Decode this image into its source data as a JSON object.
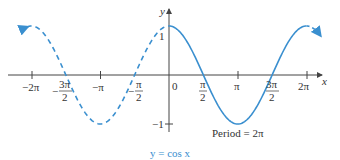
{
  "chart_data": {
    "type": "line",
    "title": "",
    "caption": "y = cos x",
    "xlabel": "x",
    "ylabel": "y",
    "xlim": [
      -6.6,
      7.0
    ],
    "ylim": [
      -1.2,
      1.4
    ],
    "grid": false,
    "x_ticks": [
      {
        "value": -6.2832,
        "label": "−2π"
      },
      {
        "value": -4.7124,
        "label_num": "−3π",
        "label_den": "2"
      },
      {
        "value": -3.1416,
        "label": "−π"
      },
      {
        "value": -1.5708,
        "label_num": "− π",
        "label_den": "2"
      },
      {
        "value": 0,
        "label": "0"
      },
      {
        "value": 1.5708,
        "label_num": "π",
        "label_den": "2"
      },
      {
        "value": 3.1416,
        "label": "π"
      },
      {
        "value": 4.7124,
        "label_num": "3π",
        "label_den": "2"
      },
      {
        "value": 6.2832,
        "label": "2π"
      }
    ],
    "y_ticks": [
      {
        "value": 1,
        "label": "1"
      },
      {
        "value": -1,
        "label": "−1"
      }
    ],
    "series": [
      {
        "name": "cos x (dashed, x < 0)",
        "function": "cos(x)",
        "x_range": [
          -6.5,
          0
        ],
        "style": "dashed",
        "color": "#3a8fcf"
      },
      {
        "name": "cos x (solid, one period)",
        "function": "cos(x)",
        "x_range": [
          0,
          6.2832
        ],
        "style": "solid",
        "color": "#3a8fcf"
      },
      {
        "name": "cos x (dashed, x > 2π)",
        "function": "cos(x)",
        "x_range": [
          6.2832,
          6.9
        ],
        "style": "dashed",
        "color": "#3a8fcf"
      }
    ],
    "key_points": [
      {
        "x": 0,
        "y": 1
      },
      {
        "x": 1.5708,
        "y": 0
      },
      {
        "x": 3.1416,
        "y": -1
      },
      {
        "x": 4.7124,
        "y": 0
      },
      {
        "x": 6.2832,
        "y": 1
      }
    ],
    "annotations": [
      {
        "text": "Period = 2π",
        "x": 3.14,
        "y": -1.2
      }
    ]
  },
  "labels": {
    "y_axis": "y",
    "x_axis": "x",
    "y_one": "1",
    "y_neg_one": "−1",
    "neg_two_pi": "−2π",
    "neg_three_pi_num": "3π",
    "neg_three_pi_den": "2",
    "neg_pi": "−π",
    "neg_half_pi_num": "π",
    "neg_half_pi_den": "2",
    "zero": "0",
    "half_pi_num": "π",
    "half_pi_den": "2",
    "pi": "π",
    "three_half_pi_num": "3π",
    "three_half_pi_den": "2",
    "two_pi": "2π",
    "minus": "−",
    "period": "Period = 2π",
    "caption": "y = cos x"
  },
  "colors": {
    "curve": "#3a8fcf",
    "axis": "#444444",
    "text": "#333333"
  }
}
